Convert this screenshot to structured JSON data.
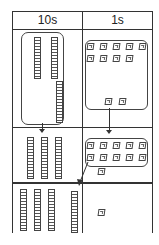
{
  "table": {
    "headers": [
      "10s",
      "1s"
    ]
  },
  "rows": [
    {
      "tens": {
        "rods": 3,
        "grouped": true
      },
      "ones": {
        "cubes": 11,
        "grouped": 9,
        "loose": 2
      }
    },
    {
      "tens": {
        "rods": 3,
        "grouped": false
      },
      "ones": {
        "cubes": 11,
        "grouped": 10,
        "loose": 1,
        "regroup_arrow_to": "tens"
      }
    },
    {
      "tens": {
        "rods": 4
      },
      "ones": {
        "cubes": 1
      }
    }
  ],
  "colors": {
    "line": "#333333",
    "background": "#ffffff"
  }
}
